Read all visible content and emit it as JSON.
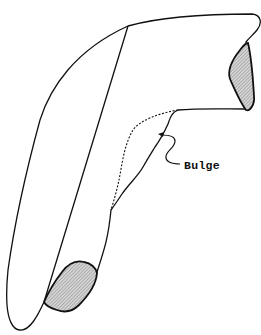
{
  "diagram": {
    "type": "anatomical-outline",
    "labels": {
      "bulge": "Bulge"
    },
    "parts": [
      {
        "name": "outer-outline",
        "style": "solid"
      },
      {
        "name": "original-contour",
        "style": "dashed"
      },
      {
        "name": "upper-end-patch",
        "style": "hatched"
      },
      {
        "name": "lower-end-patch",
        "style": "hatched"
      },
      {
        "name": "bulge-pointer",
        "style": "arrow"
      }
    ],
    "colors": {
      "stroke": "#111111",
      "hatch": "#9a9a9a",
      "background": "#ffffff"
    }
  }
}
